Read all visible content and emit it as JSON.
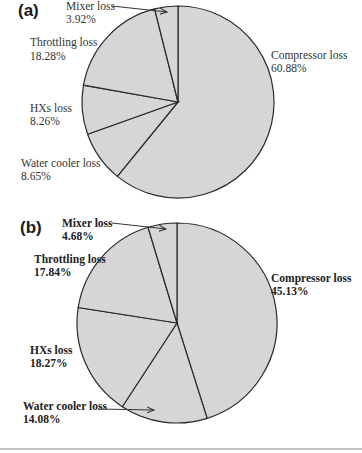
{
  "chart_data": [
    {
      "type": "pie",
      "panel": "(a)",
      "title": "",
      "categories": [
        "Compressor loss",
        "Water cooler loss",
        "HXs loss",
        "Throttling loss",
        "Mixer loss"
      ],
      "values": [
        60.88,
        8.65,
        8.26,
        18.28,
        3.92
      ],
      "labels": [
        {
          "name": "Compressor loss",
          "value": "60.88%"
        },
        {
          "name": "Water cooler loss",
          "value": "8.65%"
        },
        {
          "name": "HXs loss",
          "value": "8.26%"
        },
        {
          "name": "Throttling loss",
          "value": "18.28%"
        },
        {
          "name": "Mixer loss",
          "value": "3.92%"
        }
      ],
      "fill_color": "#d6d6d6",
      "edge_color": "#2a2a2a",
      "start_angle": "12 o'clock, clockwise"
    },
    {
      "type": "pie",
      "panel": "(b)",
      "title": "",
      "categories": [
        "Compressor loss",
        "Water cooler loss",
        "HXs loss",
        "Throttling loss",
        "Mixer loss"
      ],
      "values": [
        45.13,
        14.08,
        18.27,
        17.84,
        4.68
      ],
      "labels": [
        {
          "name": "Compressor loss",
          "value": "45.13%"
        },
        {
          "name": "Water cooler loss",
          "value": "14.08%"
        },
        {
          "name": "HXs loss",
          "value": "18.27%"
        },
        {
          "name": "Throttling loss",
          "value": "17.84%"
        },
        {
          "name": "Mixer loss",
          "value": "4.68%"
        }
      ],
      "fill_color": "#d6d6d6",
      "edge_color": "#2a2a2a",
      "start_angle": "12 o'clock, clockwise"
    }
  ],
  "panels": {
    "a": {
      "label": "(a)",
      "mixer": {
        "name": "Mixer loss",
        "value": "3.92%"
      },
      "throttling": {
        "name": "Throttling loss",
        "value": "18.28%"
      },
      "hxs": {
        "name": "HXs loss",
        "value": "8.26%"
      },
      "water": {
        "name": "Water cooler loss",
        "value": "8.65%"
      },
      "compressor": {
        "name": "Compressor loss",
        "value": "60.88%"
      }
    },
    "b": {
      "label": "(b)",
      "mixer": {
        "name": "Mixer loss",
        "value": "4.68%"
      },
      "throttling": {
        "name": "Throttling loss",
        "value": "17.84%"
      },
      "hxs": {
        "name": "HXs loss",
        "value": "18.27%"
      },
      "water": {
        "name": "Water cooler loss",
        "value": "14.08%"
      },
      "compressor": {
        "name": "Compressor loss",
        "value": "45.13%"
      }
    }
  }
}
